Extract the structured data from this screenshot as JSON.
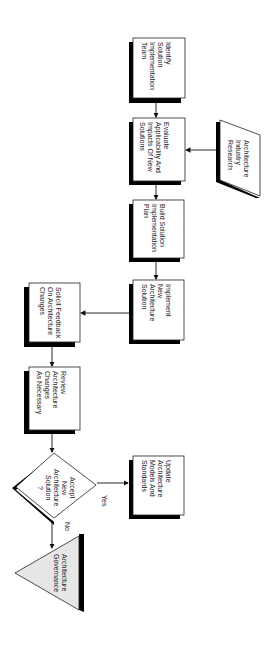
{
  "diagram": {
    "type": "flowchart",
    "orientation": "rotated-90-clockwise",
    "nodes": [
      {
        "id": "identify",
        "shape": "process",
        "label": "Identify\nSolution\nImplementation\nTeam"
      },
      {
        "id": "evaluate",
        "shape": "process",
        "label": "Evaluate\nApplicability And\nImpacts Of New\nSolutions"
      },
      {
        "id": "research",
        "shape": "data",
        "label": "Architecture\nIndustry\nResearch"
      },
      {
        "id": "build",
        "shape": "process",
        "label": "Build Solution\nImplementation\nPlan"
      },
      {
        "id": "implement",
        "shape": "process",
        "label": "Implement\nNew\nArchitecture\nSolution"
      },
      {
        "id": "solicit",
        "shape": "process",
        "label": "Solicit Feedback\nOn Architecture\nChanges"
      },
      {
        "id": "review",
        "shape": "process",
        "label": "Review\nArchitecture\nChanges\nAs Necessary"
      },
      {
        "id": "accept",
        "shape": "decision",
        "label": "Accept\nNew Architecture\nSolution\n?"
      },
      {
        "id": "update",
        "shape": "process",
        "label": "Update\nArchitecture\nModels And\nStandards"
      },
      {
        "id": "governance",
        "shape": "extract",
        "label": "Architecture\nGovernance"
      }
    ],
    "edges": [
      {
        "from": "identify",
        "to": "evaluate",
        "label": ""
      },
      {
        "from": "research",
        "to": "evaluate",
        "label": ""
      },
      {
        "from": "evaluate",
        "to": "build",
        "label": ""
      },
      {
        "from": "build",
        "to": "implement",
        "label": ""
      },
      {
        "from": "implement",
        "to": "solicit",
        "label": ""
      },
      {
        "from": "solicit",
        "to": "review",
        "label": ""
      },
      {
        "from": "review",
        "to": "accept",
        "label": ""
      },
      {
        "from": "accept",
        "to": "update",
        "label": "Yes"
      },
      {
        "from": "accept",
        "to": "governance",
        "label": "No"
      }
    ],
    "edge_labels": {
      "yes": "Yes",
      "no": "No"
    },
    "colors": {
      "stroke": "#222222",
      "shadow": "#000000",
      "fill": "#ffffff",
      "triangle_fill": "#e6e6e6"
    }
  }
}
